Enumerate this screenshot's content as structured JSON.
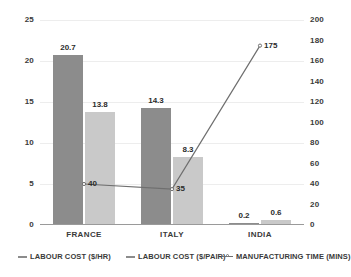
{
  "chart_data": {
    "type": "bar",
    "title": "",
    "subtitle": "",
    "xlabel": "",
    "ylabel": "",
    "categories": [
      "FRANCE",
      "ITALY",
      "INDIA"
    ],
    "series": [
      {
        "name": "LABOUR COST ($/HR)",
        "type": "bar",
        "axis": "left",
        "color": "#8c8c8c",
        "values": [
          20.7,
          14.3,
          0.2
        ],
        "labels": [
          "20.7",
          "14.3",
          "0.2"
        ]
      },
      {
        "name": "LABOUR COST ($/PAIR)",
        "type": "bar",
        "axis": "left",
        "color": "#c9c9c9",
        "values": [
          13.8,
          8.3,
          0.6
        ],
        "labels": [
          "13.8",
          "8.3",
          "0.6"
        ]
      },
      {
        "name": "MANUFACTURING TIME (MINS)",
        "type": "line",
        "axis": "right",
        "color": "#6f6f6f",
        "values": [
          40,
          35,
          175
        ],
        "labels": [
          "40",
          "35",
          "175"
        ]
      }
    ],
    "left_axis": {
      "ticks": [
        "0",
        "5",
        "10",
        "15",
        "20",
        "25"
      ],
      "min": 0,
      "max": 25
    },
    "right_axis": {
      "ticks": [
        "0",
        "20",
        "40",
        "60",
        "80",
        "100",
        "120",
        "140",
        "160",
        "180",
        "200"
      ],
      "min": 0,
      "max": 200
    },
    "grid": true,
    "legend_position": "bottom"
  },
  "legend": {
    "items": [
      {
        "label": "LABOUR COST ($/HR)"
      },
      {
        "label": "LABOUR COST ($/PAIR)"
      },
      {
        "label": "MANUFACTURING TIME (MINS)"
      }
    ]
  }
}
